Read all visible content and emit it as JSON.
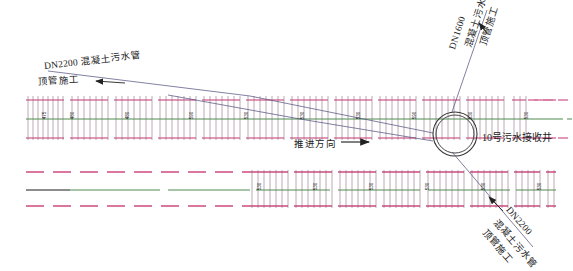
{
  "drawing": {
    "title_left": {
      "line1": "DN2200 混凝土污水管",
      "line2": "顶管施工"
    },
    "title_top_right": {
      "line1": "DN1600",
      "line2": "混凝土污水管",
      "line3": "顶管施工"
    },
    "title_bottom_right": {
      "line1": "DN2200",
      "line2": "混凝土污水管",
      "line3": "顶管施工"
    },
    "well_label": "10号污水接收井",
    "direction_label": "推进方向",
    "direction_arrow": "→"
  },
  "colors": {
    "pipe_casing": "#d9779f",
    "centerline": "#4f8a4f",
    "rib": "#8d5f7a",
    "leader": "#4a4a7a",
    "text": "#1a1a1a",
    "well_stroke": "#333333",
    "background": "#ffffff"
  },
  "upper_band": {
    "y_top": 96,
    "y_bottom": 140,
    "centerline_y": 119,
    "x_start": 26,
    "x_end": 556,
    "dimensions": [
      {
        "value": "475",
        "x": 41
      },
      {
        "value": "480",
        "x": 69
      },
      {
        "value": "480",
        "x": 124
      },
      {
        "value": "590",
        "x": 188
      },
      {
        "value": "530",
        "x": 243
      },
      {
        "value": "530",
        "x": 299
      },
      {
        "value": "530",
        "x": 355
      },
      {
        "value": "590",
        "x": 411
      },
      {
        "value": "530",
        "x": 467
      },
      {
        "value": "530",
        "x": 523
      }
    ]
  },
  "lower_band": {
    "y_top": 170,
    "y_bottom": 208,
    "centerline_y": 190,
    "x_start": 26,
    "x_end": 556,
    "hatch_start": 250,
    "dimensions": [
      {
        "value": "530",
        "x": 256
      },
      {
        "value": "530",
        "x": 312
      },
      {
        "value": "530",
        "x": 368
      },
      {
        "value": "530",
        "x": 424
      },
      {
        "value": "530",
        "x": 480
      },
      {
        "value": "530",
        "x": 536
      }
    ]
  },
  "well": {
    "cx": 455,
    "cy": 134,
    "r_outer": 22,
    "r_inner": 19
  }
}
